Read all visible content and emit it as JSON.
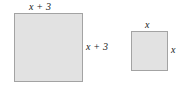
{
  "figure": {
    "background_color": "#ffffff",
    "shape_fill_color": "#e2e2e2",
    "shape_border_color": "#a3a3a3",
    "label_color": "#1a1a1a",
    "shapes": [
      {
        "name": "large-square",
        "top_label": "x + 3",
        "right_label": "x + 3"
      },
      {
        "name": "small-square",
        "top_label": "x",
        "right_label": "x"
      }
    ]
  }
}
